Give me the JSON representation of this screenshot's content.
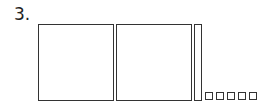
{
  "problem": {
    "number_label": "3.",
    "blocks": {
      "hundreds": 2,
      "tens": 1,
      "ones": 5
    }
  }
}
